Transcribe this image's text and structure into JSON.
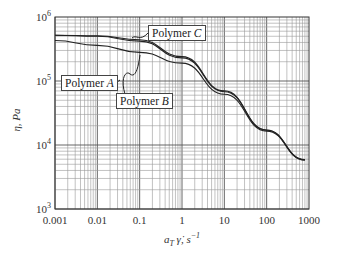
{
  "chart_data": {
    "type": "line",
    "title": "",
    "xlabel": "a_T γ̇, s^-1",
    "ylabel": "η, Pa",
    "xscale": "log",
    "yscale": "log",
    "xlim": [
      0.001,
      1000
    ],
    "ylim": [
      1000,
      1000000
    ],
    "x_ticks": [
      "0.001",
      "0.01",
      "0.1",
      "1",
      "10",
      "100",
      "1000"
    ],
    "y_ticks": [
      "10^3",
      "10^4",
      "10^5",
      "10^6"
    ],
    "grid": true,
    "legend": "inline callouts",
    "series": [
      {
        "name": "Polymer A",
        "x": [
          0.001,
          0.01,
          0.1,
          1,
          10,
          100,
          800
        ],
        "y": [
          430000,
          360000,
          280000,
          190000,
          62000,
          16500,
          5800
        ]
      },
      {
        "name": "Polymer B",
        "x": [
          0.001,
          0.01,
          0.1,
          1,
          10,
          100,
          800
        ],
        "y": [
          520000,
          500000,
          420000,
          230000,
          68000,
          17000,
          5900
        ]
      },
      {
        "name": "Polymer C",
        "x": [
          0.001,
          0.01,
          0.1,
          1,
          10,
          100,
          800
        ],
        "y": [
          520000,
          510000,
          440000,
          240000,
          70000,
          17200,
          5900
        ]
      }
    ]
  },
  "labels": {
    "polymer_a_prefix": "Polymer ",
    "polymer_a_letter": "A",
    "polymer_b_prefix": "Polymer ",
    "polymer_b_letter": "B",
    "polymer_c_prefix": "Polymer ",
    "polymer_c_letter": "C",
    "y_axis": "η, Pa",
    "x_axis_main": "a",
    "x_axis_sub": "T",
    "x_axis_rest": " γ̇, s",
    "x_axis_sup": "−1"
  }
}
